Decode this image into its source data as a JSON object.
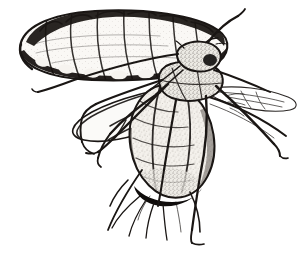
{
  "figure": {
    "medium": "pen-and-ink stipple engraving",
    "background_color": "#ffffff",
    "ink_color": "#1a1614",
    "body_fill_color": "#f2efea",
    "canvas": {
      "width": 305,
      "height": 256
    }
  },
  "subjects": [
    {
      "name": "nymph",
      "label": "aphid nymph",
      "description": "elongated oval segmented larval body, dorsal view, upper left",
      "segment_count": 9,
      "position": {
        "x": 14,
        "y": 10,
        "width": 215,
        "height": 70
      }
    },
    {
      "name": "adult",
      "label": "winged adult aphid",
      "description": "alate aphid in lateral view with wings, six legs and paired antennae",
      "position": {
        "x": 35,
        "y": 45,
        "width": 265,
        "height": 205
      }
    }
  ],
  "anatomy": {
    "head": {
      "label": "head",
      "position": {
        "x": 185,
        "y": 48
      }
    },
    "thorax": {
      "label": "thorax",
      "position": {
        "x": 178,
        "y": 78
      }
    },
    "abdomen": {
      "label": "abdomen",
      "position": {
        "x": 172,
        "y": 140
      }
    },
    "forewing": {
      "label": "forewing",
      "position": {
        "x": 120,
        "y": 95
      }
    },
    "hindwing": {
      "label": "hindwing",
      "position": {
        "x": 250,
        "y": 105
      }
    },
    "antenna_left": {
      "label": "left antenna",
      "length": 150
    },
    "antenna_right": {
      "label": "right antenna",
      "length": 45
    },
    "legs": [
      {
        "label": "foreleg",
        "position": "left"
      },
      {
        "label": "midleg",
        "position": "left-lower"
      },
      {
        "label": "hindleg",
        "position": "center-lower"
      },
      {
        "label": "foreleg",
        "position": "right"
      },
      {
        "label": "midleg",
        "position": "right-lower"
      },
      {
        "label": "hindleg",
        "position": "right-trailing"
      }
    ],
    "cornicles": {
      "label": "cornicles",
      "count": 2
    }
  },
  "caption": ""
}
